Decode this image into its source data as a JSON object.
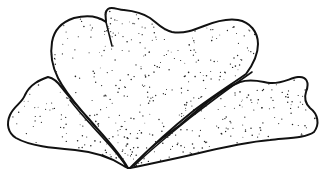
{
  "illustration": {
    "subject": "stippled-lobed-thallus",
    "style": "black ink stipple line drawing",
    "colors": {
      "ink": "#111111",
      "background": "#ffffff"
    },
    "parts": [
      "central-lobe",
      "left-lobe",
      "right-lobe"
    ]
  }
}
